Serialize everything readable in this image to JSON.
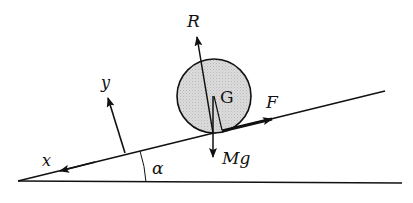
{
  "diagram": {
    "labels": {
      "normal_reaction": "R",
      "center_of_mass": "G",
      "friction_force": "F",
      "weight": "Mg",
      "y_axis": "y",
      "x_axis": "x",
      "incline_angle": "α"
    },
    "colors": {
      "stroke": "#111111",
      "body_fill": "#d4d4d4",
      "background": "#ffffff"
    }
  }
}
